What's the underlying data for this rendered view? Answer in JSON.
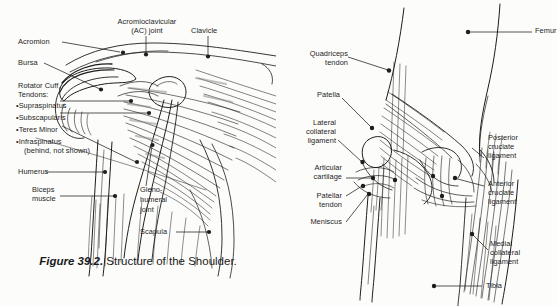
{
  "figure": {
    "number_label": "Figure 39.2.",
    "caption_text": " Structure of the Shoulder."
  },
  "shoulder": {
    "title": "Structure of the Shoulder",
    "labels": {
      "acromion": "Acromion",
      "ac_joint_line1": "Acromioclavicular",
      "ac_joint_line2": "(AC) joint",
      "clavicle": "Clavicle",
      "bursa": "Bursa",
      "rotator_cuff_line1": "Rotator Cuff",
      "rotator_cuff_line2": "Tendons:",
      "rc_item1": "•Supraspinatus",
      "rc_item2": "•Subscapularis",
      "rc_item3": "•Teres Minor",
      "rc_item4": "•Infraspinatus",
      "rc_item4b": " (behind, not shown)",
      "humerus": "Humerus",
      "biceps_line1": "Biceps",
      "biceps_line2": "muscle",
      "glenohumeral_line1": "Gleno-",
      "glenohumeral_line2": "humeral",
      "glenohumeral_line3": "joint",
      "scapula": "Scapula"
    }
  },
  "knee": {
    "title": "Structure of the Knee",
    "labels": {
      "quadriceps_line1": "Quadriceps",
      "quadriceps_line2": "tendon",
      "femur": "Femur",
      "patella": "Patella",
      "lateral_collateral_line1": "Lateral",
      "lateral_collateral_line2": "collateral",
      "lateral_collateral_line3": "ligament",
      "posterior_cruciate_line1": "Posterior",
      "posterior_cruciate_line2": "cruciate",
      "posterior_cruciate_line3": "ligament",
      "articular_line1": "Articular",
      "articular_line2": "cartilage",
      "anterior_cruciate_line1": "Anterior",
      "anterior_cruciate_line2": "cruciate",
      "anterior_cruciate_line3": "ligament",
      "patellar_tendon_line1": "Patellar",
      "patellar_tendon_line2": "tendon",
      "meniscus": "Meniscus",
      "medial_collateral_line1": "Medial",
      "medial_collateral_line2": "collateral",
      "medial_collateral_line3": "ligament",
      "tibia": "Tibia"
    }
  },
  "colors": {
    "ink": "#1d1d1d",
    "background": "#fcfcfa",
    "shade": "#9a9a9a"
  }
}
